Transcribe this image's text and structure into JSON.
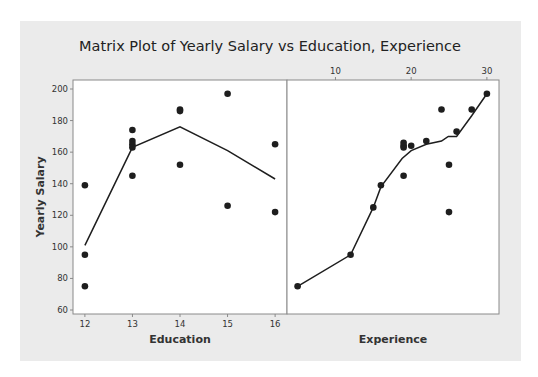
{
  "chart_data": {
    "type": "scatter",
    "title": "Matrix Plot of Yearly Salary vs Education, Experience",
    "ylabel": "Yearly Salary",
    "ylim": [
      60,
      200
    ],
    "yticks": [
      60,
      80,
      100,
      120,
      140,
      160,
      180,
      200
    ],
    "grid": false,
    "legend": null,
    "panels": [
      {
        "name": "education",
        "xlabel": "Education",
        "xtick_position": "bottom",
        "xticks": [
          12,
          13,
          14,
          15,
          16
        ],
        "xlim": [
          11.75,
          16.25
        ],
        "points": [
          {
            "x": 12,
            "y": 139
          },
          {
            "x": 12,
            "y": 95
          },
          {
            "x": 12,
            "y": 75
          },
          {
            "x": 13,
            "y": 174
          },
          {
            "x": 13,
            "y": 167
          },
          {
            "x": 13,
            "y": 165
          },
          {
            "x": 13,
            "y": 163
          },
          {
            "x": 13,
            "y": 145
          },
          {
            "x": 14,
            "y": 187
          },
          {
            "x": 14,
            "y": 186
          },
          {
            "x": 14,
            "y": 152
          },
          {
            "x": 15,
            "y": 197
          },
          {
            "x": 15,
            "y": 126
          },
          {
            "x": 16,
            "y": 165
          },
          {
            "x": 16,
            "y": 122
          }
        ],
        "smoother": [
          {
            "x": 12,
            "y": 101
          },
          {
            "x": 13,
            "y": 163
          },
          {
            "x": 14,
            "y": 176
          },
          {
            "x": 15,
            "y": 161
          },
          {
            "x": 16,
            "y": 143
          }
        ]
      },
      {
        "name": "experience",
        "xlabel": "Experience",
        "xtick_position": "top",
        "xticks": [
          10,
          20,
          30
        ],
        "xlim": [
          3.6,
          31.6
        ],
        "points": [
          {
            "x": 5,
            "y": 75
          },
          {
            "x": 12,
            "y": 95
          },
          {
            "x": 15,
            "y": 125
          },
          {
            "x": 16,
            "y": 139
          },
          {
            "x": 19,
            "y": 145
          },
          {
            "x": 19,
            "y": 163
          },
          {
            "x": 19,
            "y": 164
          },
          {
            "x": 19,
            "y": 166
          },
          {
            "x": 20,
            "y": 164
          },
          {
            "x": 22,
            "y": 167
          },
          {
            "x": 24,
            "y": 187
          },
          {
            "x": 25,
            "y": 152
          },
          {
            "x": 25,
            "y": 122
          },
          {
            "x": 26,
            "y": 173
          },
          {
            "x": 28,
            "y": 187
          },
          {
            "x": 30,
            "y": 197
          }
        ],
        "smoother": [
          {
            "x": 5,
            "y": 75
          },
          {
            "x": 12,
            "y": 95
          },
          {
            "x": 15,
            "y": 125
          },
          {
            "x": 16,
            "y": 138
          },
          {
            "x": 18.8,
            "y": 156
          },
          {
            "x": 20,
            "y": 161
          },
          {
            "x": 22,
            "y": 165
          },
          {
            "x": 24,
            "y": 167
          },
          {
            "x": 24.9,
            "y": 170
          },
          {
            "x": 26,
            "y": 170
          },
          {
            "x": 28,
            "y": 183
          },
          {
            "x": 30,
            "y": 197
          }
        ]
      }
    ]
  },
  "colors": {
    "background": "#ebebeb",
    "plot_area": "#ffffff",
    "frame": "#8a8a8a",
    "marker": "#1e1e1e",
    "line": "#1e1e1e"
  }
}
